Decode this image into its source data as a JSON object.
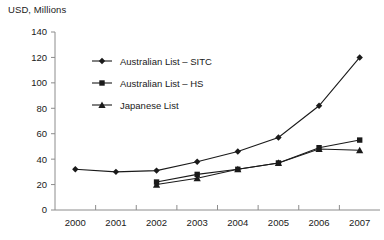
{
  "chart_data": {
    "type": "line",
    "title": "USD, Millions",
    "xlabel": "",
    "ylabel": "USD, Millions",
    "categories": [
      "2000",
      "2001",
      "2002",
      "2003",
      "2004",
      "2005",
      "2006",
      "2007"
    ],
    "x": [
      2000,
      2001,
      2002,
      2003,
      2004,
      2005,
      2006,
      2007
    ],
    "xlim": [
      1999.5,
      2007.5
    ],
    "ylim": [
      0,
      140
    ],
    "yticks": [
      0,
      20,
      40,
      60,
      80,
      100,
      120,
      140
    ],
    "ytick_labels": [
      "0",
      "20",
      "40",
      "60",
      "80",
      "100",
      "120",
      "140"
    ],
    "grid": false,
    "legend_position": "upper-left-inside",
    "series": [
      {
        "name": "Australian List – SITC",
        "marker": "diamond",
        "values": [
          32,
          30,
          31,
          38,
          46,
          57,
          82,
          120
        ]
      },
      {
        "name": "Australian List – HS",
        "marker": "square",
        "values": [
          null,
          null,
          22,
          28,
          32,
          37,
          49,
          55
        ]
      },
      {
        "name": "Japanese List",
        "marker": "triangle",
        "values": [
          null,
          null,
          20,
          25,
          32,
          37,
          48,
          47
        ]
      }
    ]
  },
  "colors": {
    "line": "#1a1a1a",
    "axis": "#8c8c8c",
    "text": "#1a1a1a",
    "background": "#ffffff"
  }
}
